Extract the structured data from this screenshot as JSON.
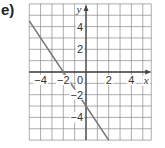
{
  "problem_label": "e)",
  "chart_data": {
    "type": "line",
    "title": "",
    "xlabel": "x",
    "ylabel": "y",
    "xlim": [
      -5,
      5.75
    ],
    "ylim": [
      -6,
      6
    ],
    "grid": true,
    "grid_step": 1,
    "origin_label": "0",
    "x_ticks": [
      -4,
      -2,
      2,
      4
    ],
    "x_tick_labels": [
      "−4",
      "−2",
      "2",
      "4"
    ],
    "y_ticks": [
      4,
      2,
      -2,
      -4
    ],
    "y_tick_labels": [
      "4",
      "2",
      "−2",
      "−4"
    ],
    "series": [
      {
        "name": "line",
        "equation": "y = -1.5x - 3",
        "x": [
          -5,
          2
        ],
        "y": [
          4.5,
          -6
        ],
        "color": "#777777"
      }
    ],
    "intercepts": {
      "x_intercept": -2,
      "y_intercept": -3
    },
    "colors": {
      "grid": "#8a8a8a",
      "axes": "#444444",
      "line": "#777777"
    }
  }
}
